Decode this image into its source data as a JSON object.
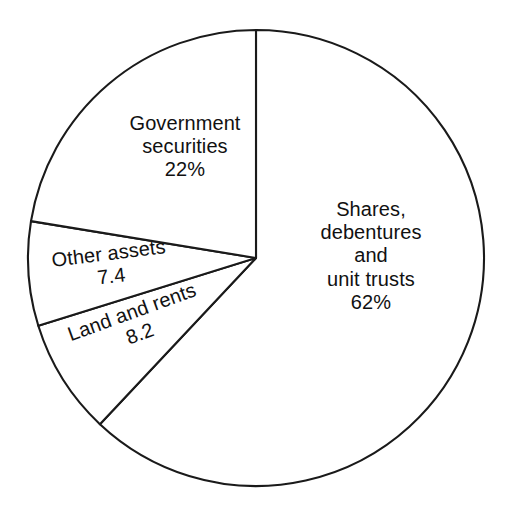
{
  "chart_data": {
    "type": "pie",
    "title": "",
    "subtitle": "",
    "xlabel": "",
    "ylabel": "",
    "legend_position": "none",
    "grid": false,
    "start_angle_deg": 0,
    "direction": "clockwise",
    "categories": [
      "Shares, debentures and unit trusts",
      "Land and rents",
      "Other assets",
      "Government securities"
    ],
    "values": [
      62,
      8.2,
      7.4,
      22
    ],
    "value_labels": [
      "62%",
      "8.2",
      "7.4",
      "22%"
    ],
    "slices": [
      {
        "key": "shares",
        "name": "Shares, debentures and unit trusts",
        "value": 62,
        "value_label": "62%",
        "start_deg": 0,
        "end_deg": 223.2,
        "fill": "#ffffff",
        "stroke": "#1a1a1a",
        "label_lines": [
          "Shares,",
          "debentures",
          "and",
          "unit trusts",
          "62%"
        ]
      },
      {
        "key": "land_and_rents",
        "name": "Land and rents",
        "value": 8.2,
        "value_label": "8.2",
        "start_deg": 223.2,
        "end_deg": 252.7,
        "fill": "#ffffff",
        "stroke": "#1a1a1a",
        "label_lines": [
          "Land and rents",
          "8.2"
        ]
      },
      {
        "key": "other_assets",
        "name": "Other assets",
        "value": 7.4,
        "value_label": "7.4",
        "start_deg": 252.7,
        "end_deg": 279.3,
        "fill": "#ffffff",
        "stroke": "#1a1a1a",
        "label_lines": [
          "Other assets",
          "7.4"
        ]
      },
      {
        "key": "government_securities",
        "name": "Government securities",
        "value": 22,
        "value_label": "22%",
        "start_deg": 279.3,
        "end_deg": 360,
        "fill": "#ffffff",
        "stroke": "#1a1a1a",
        "label_lines": [
          "Government",
          "securities",
          "22%"
        ]
      }
    ]
  },
  "labels": {
    "government": {
      "line1": "Government",
      "line2": "securities",
      "line3": "22%"
    },
    "shares": {
      "line1": "Shares,",
      "line2": "debentures",
      "line3": "and",
      "line4": "unit trusts",
      "line5": "62%"
    },
    "other_assets": {
      "line1": "Other assets",
      "line2": "7.4"
    },
    "land_rents": {
      "line1": "Land and rents",
      "line2": "8.2"
    }
  },
  "style": {
    "background": "#ffffff",
    "line_color": "#1a1a1a",
    "text_color": "#111111"
  },
  "geometry": {
    "center_x": 256,
    "center_y": 258,
    "radius": 228
  }
}
